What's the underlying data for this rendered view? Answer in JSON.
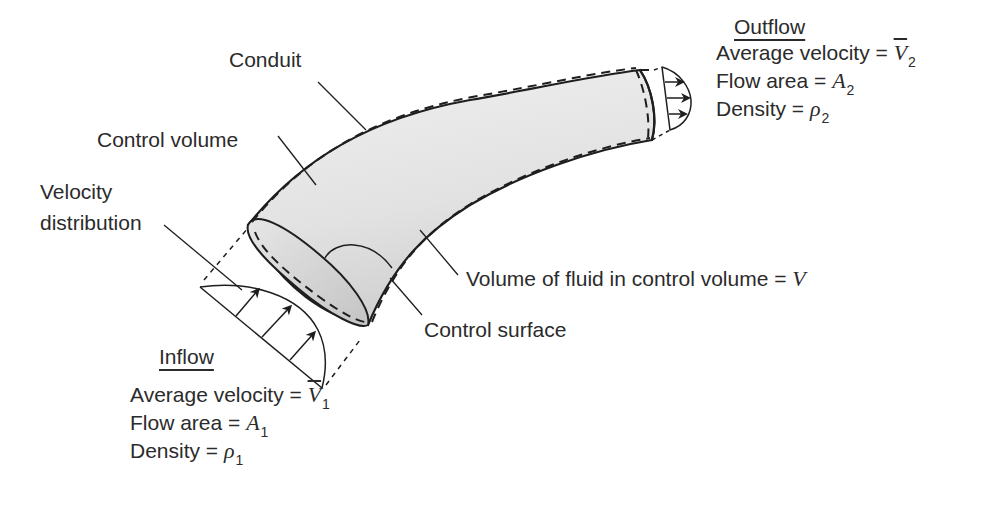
{
  "diagram": {
    "labels": {
      "conduit": "Conduit",
      "control_volume": "Control volume",
      "velocity_distribution_line1": "Velocity",
      "velocity_distribution_line2": "distribution",
      "volume_of_fluid": "Volume of fluid in control volume =",
      "volume_symbol": "V",
      "control_surface": "Control surface"
    },
    "outflow": {
      "heading": "Outflow",
      "velocity_label": "Average velocity =",
      "velocity_symbol": "V",
      "velocity_sub": "2",
      "area_label": "Flow area =",
      "area_symbol": "A",
      "area_sub": "2",
      "density_label": "Density =",
      "density_symbol": "ρ",
      "density_sub": "2"
    },
    "inflow": {
      "heading": "Inflow",
      "velocity_label": "Average velocity =",
      "velocity_symbol": "V",
      "velocity_sub": "1",
      "area_label": "Flow area =",
      "area_symbol": "A",
      "area_sub": "1",
      "density_label": "Density =",
      "density_symbol": "ρ",
      "density_sub": "1"
    },
    "colors": {
      "stroke": "#1e1e1e",
      "fill_light": "#ededed",
      "fill_dark": "#cfcfcf",
      "text": "#2b2b2b"
    }
  }
}
